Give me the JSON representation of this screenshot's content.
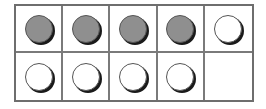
{
  "ten_frame": {
    "rows": 2,
    "columns": 5,
    "filled_color": "#8f8f8f",
    "empty_color": "#ffffff",
    "cells": [
      [
        "filled",
        "filled",
        "filled",
        "filled",
        "empty"
      ],
      [
        "empty",
        "empty",
        "empty",
        "empty",
        "none"
      ]
    ],
    "counts": {
      "filled": 4,
      "empty": 5,
      "blank_cells": 1,
      "total_counters": 9
    }
  }
}
